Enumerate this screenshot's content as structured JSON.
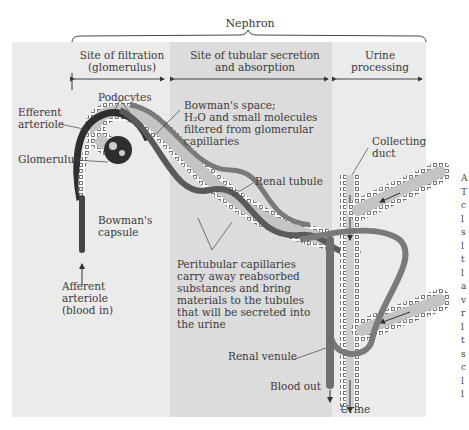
{
  "title": "Nephron",
  "colors": {
    "panel_left": "#ebebeb",
    "panel_middle": "#dcdcdc",
    "panel_right": "#ebebeb",
    "vessel": "#7a7a7a",
    "vessel_dark": "#3c3c3c",
    "tubule_fill": "#c4c4c4"
  },
  "sections": [
    {
      "line1": "Site of filtration",
      "line2": "(glomerulus)"
    },
    {
      "line1": "Site of tubular secretion",
      "line2": "and absorption"
    },
    {
      "line1": "Urine",
      "line2": "processing"
    }
  ],
  "labels": {
    "efferent": [
      "Efferent",
      "arteriole"
    ],
    "podocytes": "Podocytes",
    "glomerulus": "Glomerulus",
    "bowmans_capsule": [
      "Bowman's",
      "capsule"
    ],
    "afferent": [
      "Afferent",
      "arteriole",
      "(blood in)"
    ],
    "bowmans_space": [
      "Bowman's space;",
      "H₂O and small molecules",
      "filtered from glomerular",
      "capillaries"
    ],
    "renal_tubule": "Renal tubule",
    "peritubular": [
      "Peritubular capillaries",
      "carry away reabsorbed",
      "substances and bring",
      "materials to the tubules",
      "that will be secreted into",
      "the urine"
    ],
    "collecting_duct": [
      "Collecting",
      "duct"
    ],
    "renal_venule": "Renal venule",
    "blood_out": "Blood out",
    "urine": "Urine"
  },
  "side_fragments": [
    "A",
    "T",
    "c",
    "l",
    "s",
    "l",
    "t",
    "l",
    "a",
    "v",
    "r",
    "l",
    "t",
    "s",
    "c",
    "l",
    "l"
  ]
}
